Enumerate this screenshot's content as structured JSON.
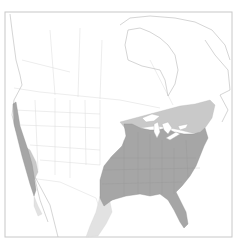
{
  "map": {
    "type": "range-map",
    "region": "North America",
    "legend": [],
    "colors": {
      "background": "#ffffff",
      "frame": "#c8c8c8",
      "coastline": "#b8b8b8",
      "political_borders": "#dadada",
      "range_primary": "#a6a6a6",
      "range_secondary": "#c9c9c9",
      "range_tertiary": "#e2e2e2"
    }
  }
}
